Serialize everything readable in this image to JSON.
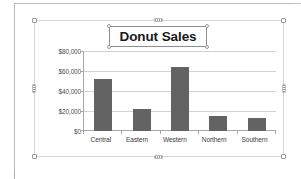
{
  "document": {
    "object_state": "selected"
  },
  "chart_data": {
    "type": "bar",
    "title": "Donut Sales",
    "categories": [
      "Central",
      "Eastern",
      "Western",
      "Northern",
      "Southern"
    ],
    "values": [
      52000,
      22000,
      64000,
      15000,
      13000
    ],
    "xlabel": "",
    "ylabel": "",
    "ylim": [
      0,
      80000
    ],
    "ytick_labels": [
      "$80,000",
      "$60,000",
      "$40,000",
      "$20,000",
      "$0"
    ],
    "ytick_values": [
      80000,
      60000,
      40000,
      20000,
      0
    ],
    "grid": true,
    "legend": false,
    "series_color": "#636363",
    "gridline_color": "#d2d2d2"
  }
}
